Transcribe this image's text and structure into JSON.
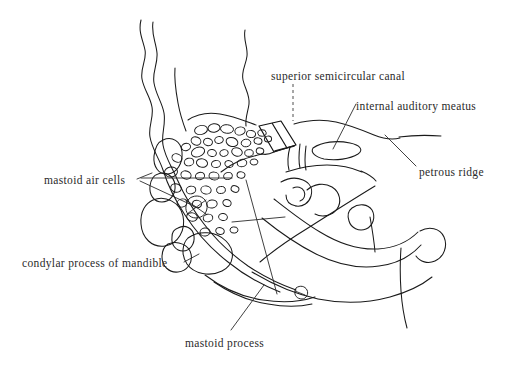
{
  "figure": {
    "background_color": "#ffffff",
    "ink_color": "#1a1a1a",
    "text_color": "#2a2a2a"
  },
  "labels": [
    {
      "id": "superior-semicircular-canal",
      "text": "superior semicircular canal",
      "x": 271,
      "y": 70,
      "align": "left",
      "leader": "dashed-vertical"
    },
    {
      "id": "internal-auditory-meatus",
      "text": "internal auditory meatus",
      "x": 356,
      "y": 100,
      "align": "left",
      "leader": "diagonal-down-left"
    },
    {
      "id": "petrous-ridge",
      "text": "petrous ridge",
      "x": 419,
      "y": 166,
      "align": "left",
      "leader": "diagonal-up-left"
    },
    {
      "id": "mastoid-air-cells",
      "text": "mastoid air cells",
      "x": 44,
      "y": 174,
      "align": "left",
      "leader": "two-branch-right"
    },
    {
      "id": "condylar-process-of-mandible",
      "text": "condylar process of mandible",
      "x": 22,
      "y": 257,
      "align": "left",
      "leader": "short-right"
    },
    {
      "id": "mastoid-process",
      "text": "mastoid process",
      "x": 185,
      "y": 337,
      "align": "left",
      "leader": "diagonal-up-right"
    }
  ],
  "structures": [
    {
      "id": "skull-outline-outer",
      "name": "outer cranial contour"
    },
    {
      "id": "skull-outline-inner",
      "name": "inner cranial contour"
    },
    {
      "id": "skull-outline-third",
      "name": "third cranial contour"
    },
    {
      "id": "upper-right-wavy",
      "name": "upper right cranial contour"
    },
    {
      "id": "mastoid-air-cell-cluster",
      "name": "mastoid air cells",
      "count": 48
    },
    {
      "id": "superior-semicircular-canal-band",
      "name": "superior semicircular canal"
    },
    {
      "id": "internal-auditory-meatus-oval",
      "name": "internal auditory meatus"
    },
    {
      "id": "petrous-ridge-line",
      "name": "petrous ridge"
    },
    {
      "id": "condylar-process-outline",
      "name": "condylar process of mandible"
    },
    {
      "id": "mastoid-process-tip",
      "name": "mastoid process"
    },
    {
      "id": "zygomatic-arch-curves",
      "name": "lower sweeping arch curves"
    }
  ]
}
